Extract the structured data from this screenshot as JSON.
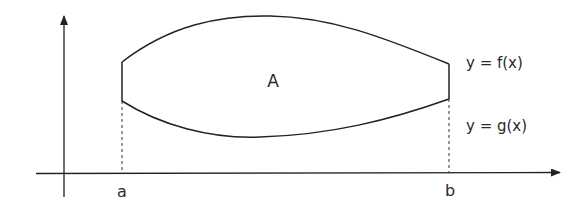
{
  "diagram": {
    "region_label": "A",
    "upper_curve_label": "y = f(x)",
    "lower_curve_label": "y = g(x)",
    "left_bound_label": "a",
    "right_bound_label": "b",
    "colors": {
      "stroke": "#222222",
      "background": "#ffffff"
    }
  }
}
